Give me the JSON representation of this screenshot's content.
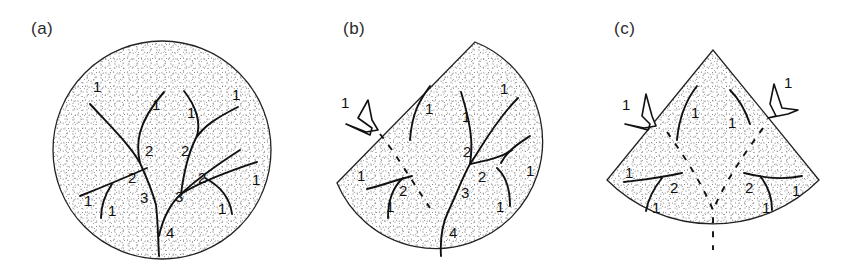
{
  "figure": {
    "panels": [
      {
        "id": "a",
        "label": "(a)",
        "shape": "circle",
        "numbers": [
          {
            "text": "1",
            "x": 93,
            "y": 92
          },
          {
            "text": "1",
            "x": 152,
            "y": 110
          },
          {
            "text": "1",
            "x": 187,
            "y": 118
          },
          {
            "text": "1",
            "x": 232,
            "y": 100
          },
          {
            "text": "2",
            "x": 145,
            "y": 156
          },
          {
            "text": "2",
            "x": 181,
            "y": 156
          },
          {
            "text": "2",
            "x": 128,
            "y": 183
          },
          {
            "text": "2",
            "x": 198,
            "y": 183
          },
          {
            "text": "3",
            "x": 140,
            "y": 203
          },
          {
            "text": "3",
            "x": 175,
            "y": 202
          },
          {
            "text": "1",
            "x": 84,
            "y": 206
          },
          {
            "text": "1",
            "x": 108,
            "y": 216
          },
          {
            "text": "1",
            "x": 252,
            "y": 185
          },
          {
            "text": "1",
            "x": 218,
            "y": 214
          },
          {
            "text": "4",
            "x": 166,
            "y": 238
          }
        ]
      },
      {
        "id": "b",
        "label": "(b)",
        "shape": "truncated-circle",
        "arrow_label": "1",
        "numbers": [
          {
            "text": "1",
            "x": 425,
            "y": 114
          },
          {
            "text": "1",
            "x": 462,
            "y": 122
          },
          {
            "text": "1",
            "x": 500,
            "y": 94
          },
          {
            "text": "2",
            "x": 463,
            "y": 157
          },
          {
            "text": "1",
            "x": 357,
            "y": 181
          },
          {
            "text": "2",
            "x": 399,
            "y": 196
          },
          {
            "text": "1",
            "x": 386,
            "y": 212
          },
          {
            "text": "2",
            "x": 478,
            "y": 182
          },
          {
            "text": "3",
            "x": 461,
            "y": 198
          },
          {
            "text": "1",
            "x": 526,
            "y": 176
          },
          {
            "text": "1",
            "x": 496,
            "y": 212
          },
          {
            "text": "4",
            "x": 449,
            "y": 238
          }
        ]
      },
      {
        "id": "c",
        "label": "(c)",
        "shape": "sector",
        "arrow_labels": [
          "1",
          "1"
        ],
        "numbers": [
          {
            "text": "1",
            "x": 691,
            "y": 118
          },
          {
            "text": "1",
            "x": 728,
            "y": 128
          },
          {
            "text": "1",
            "x": 625,
            "y": 178
          },
          {
            "text": "2",
            "x": 670,
            "y": 193
          },
          {
            "text": "1",
            "x": 652,
            "y": 213
          },
          {
            "text": "2",
            "x": 745,
            "y": 193
          },
          {
            "text": "1",
            "x": 792,
            "y": 196
          },
          {
            "text": "1",
            "x": 762,
            "y": 213
          }
        ]
      }
    ],
    "colors": {
      "ink": "#111111",
      "stipple": "#555555",
      "background": "#ffffff"
    }
  }
}
